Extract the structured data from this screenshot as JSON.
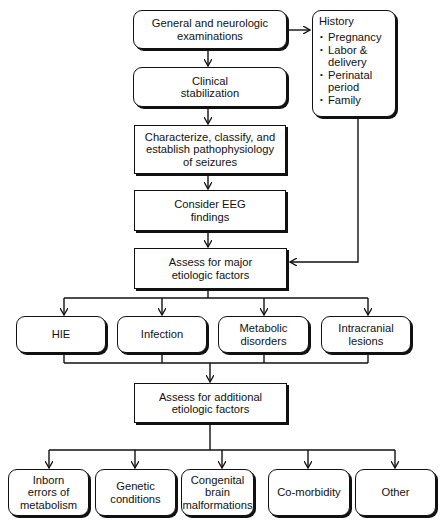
{
  "diagram": {
    "type": "flowchart",
    "main_steps": [
      {
        "id": "exam",
        "label": "General and neurologic\nexaminations",
        "shape": "rounded"
      },
      {
        "id": "stabilize",
        "label": "Clinical\nstabilization",
        "shape": "rounded"
      },
      {
        "id": "characterize",
        "label": "Characterize, classify, and\nestablish pathophysiology\nof seizures",
        "shape": "rectangle"
      },
      {
        "id": "eeg",
        "label": "Consider EEG\nfindings",
        "shape": "rectangle"
      },
      {
        "id": "major",
        "label": "Assess for major\netiologic factors",
        "shape": "rectangle"
      },
      {
        "id": "additional",
        "label": "Assess for additional\netiologic factors",
        "shape": "rectangle"
      }
    ],
    "history": {
      "title": "History",
      "items": [
        "Pregnancy",
        "Labor &\ndelivery",
        "Perinatal\nperiod",
        "Family"
      ]
    },
    "major_factors": [
      {
        "label": "HIE"
      },
      {
        "label": "Infection"
      },
      {
        "label": "Metabolic\ndisorders"
      },
      {
        "label": "Intracranial\nlesions"
      }
    ],
    "additional_factors": [
      {
        "label": "Inborn\nerrors of\nmetabolism"
      },
      {
        "label": "Genetic\nconditions"
      },
      {
        "label": "Congenital\nbrain\nmalformations"
      },
      {
        "label": "Co-morbidity"
      },
      {
        "label": "Other"
      }
    ],
    "edges": [
      [
        "exam",
        "stabilize"
      ],
      [
        "exam",
        "history"
      ],
      [
        "stabilize",
        "characterize"
      ],
      [
        "characterize",
        "eeg"
      ],
      [
        "eeg",
        "major"
      ],
      [
        "history",
        "major"
      ],
      [
        "major",
        "HIE"
      ],
      [
        "major",
        "Infection"
      ],
      [
        "major",
        "Metabolic disorders"
      ],
      [
        "major",
        "Intracranial lesions"
      ],
      [
        "major_factors",
        "additional"
      ],
      [
        "additional",
        "Inborn errors of metabolism"
      ],
      [
        "additional",
        "Genetic conditions"
      ],
      [
        "additional",
        "Congenital brain malformations"
      ],
      [
        "additional",
        "Co-morbidity"
      ],
      [
        "additional",
        "Other"
      ]
    ]
  },
  "colors": {
    "line": "#111111",
    "background": "#ffffff"
  }
}
